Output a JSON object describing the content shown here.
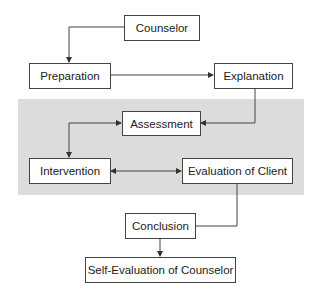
{
  "diagram": {
    "type": "flowchart",
    "nodes": {
      "counselor": "Counselor",
      "preparation": "Preparation",
      "explanation": "Explanation",
      "assessment": "Assessment",
      "intervention": "Intervention",
      "evaluation_client": "Evaluation of Client",
      "conclusion": "Conclusion",
      "self_evaluation": "Self-Evaluation of Counselor"
    },
    "edges": [
      {
        "from": "Counselor",
        "to": "Preparation"
      },
      {
        "from": "Preparation",
        "to": "Explanation"
      },
      {
        "from": "Explanation",
        "to": "Assessment"
      },
      {
        "from": "Assessment",
        "to": "Intervention",
        "bidirectional": true
      },
      {
        "from": "Intervention",
        "to": "Evaluation of Client",
        "bidirectional": true
      },
      {
        "from": "Evaluation of Client",
        "to": "Conclusion"
      },
      {
        "from": "Conclusion",
        "to": "Self-Evaluation of Counselor"
      }
    ],
    "colors": {
      "band": "#dcdcdc",
      "stroke": "#444444"
    }
  }
}
